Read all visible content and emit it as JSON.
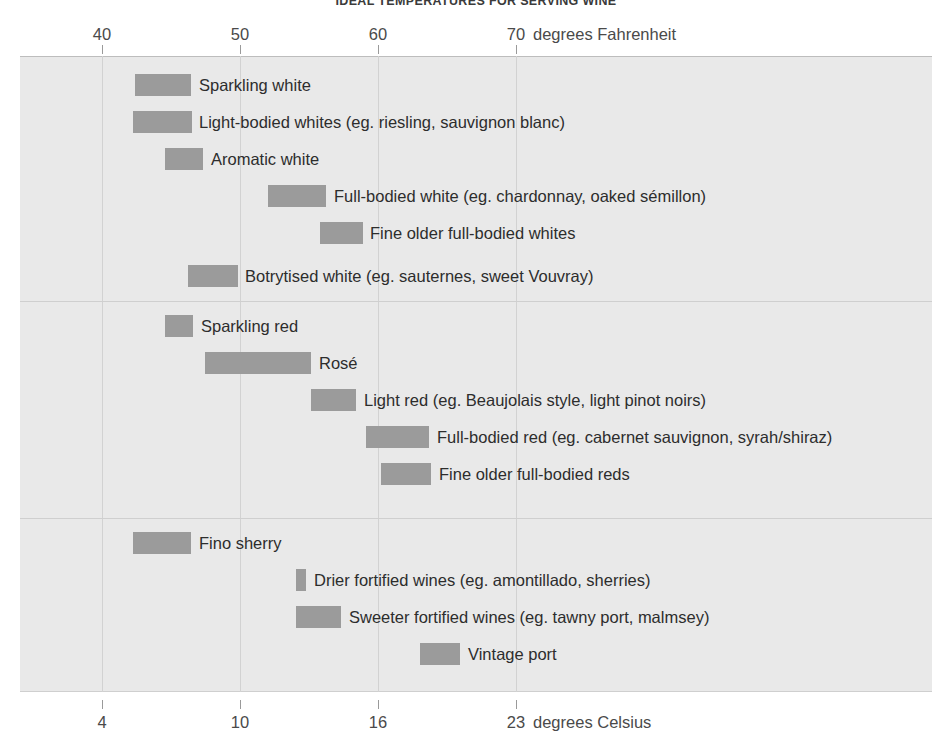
{
  "title": "IDEAL TEMPERATURES FOR SERVING WINE",
  "axis_top": {
    "unit_label": "degrees Fahrenheit",
    "ticks": [
      {
        "label": "40",
        "value": 40
      },
      {
        "label": "50",
        "value": 50
      },
      {
        "label": "60",
        "value": 60
      },
      {
        "label": "70",
        "value": 70
      }
    ]
  },
  "axis_bottom": {
    "unit_label": "degrees Celsius",
    "ticks": [
      {
        "label": "4",
        "value": 4
      },
      {
        "label": "10",
        "value": 10
      },
      {
        "label": "16",
        "value": 16
      },
      {
        "label": "23",
        "value": 23
      }
    ]
  },
  "colors": {
    "bar": "#9b9b9b",
    "plot_background": "#e9e9e9",
    "grid": "#d2d2d2",
    "text": "#2d2d2d"
  },
  "chart_data": {
    "type": "bar",
    "orientation": "horizontal",
    "title": "IDEAL TEMPERATURES FOR SERVING WINE",
    "xlabel": "degrees Fahrenheit",
    "xlabel_secondary": "degrees Celsius",
    "ylabel": "",
    "xlim": [
      32.6,
      98
    ],
    "grid": true,
    "legend": "none",
    "value_unit": "degrees Fahrenheit (range low to high)",
    "note": "Each bar spans the recommended serving temperature range for that wine style.",
    "groups": [
      {
        "name": "White wines",
        "items": [
          {
            "label": "Sparkling white",
            "low_f": 39.5,
            "high_f": 43.5,
            "low_c": 4.2,
            "high_c": 6.4
          },
          {
            "label": "Light-bodied whites (eg. riesling, sauvignon blanc)",
            "low_f": 39.3,
            "high_f": 43.6,
            "low_c": 4.1,
            "high_c": 6.4
          },
          {
            "label": "Aromatic white",
            "low_f": 41.6,
            "high_f": 44.4,
            "low_c": 5.3,
            "high_c": 6.9
          },
          {
            "label": "Full-bodied white (eg. chardonnay, oaked sémillon)",
            "low_f": 49.1,
            "high_f": 53.3,
            "low_c": 9.5,
            "high_c": 11.8
          },
          {
            "label": "Fine older full-bodied whites",
            "low_f": 52.9,
            "high_f": 56.0,
            "low_c": 11.6,
            "high_c": 13.3
          },
          {
            "label": "Botrytised white (eg. sauternes, sweet Vouvray)",
            "low_f": 41.2,
            "high_f": 44.8,
            "low_c": 5.1,
            "high_c": 7.1
          }
        ]
      },
      {
        "name": "Red wines",
        "items": [
          {
            "label": "Sparkling red",
            "low_f": 41.9,
            "high_f": 43.9,
            "low_c": 5.5,
            "high_c": 6.6
          },
          {
            "label": "Rosé",
            "low_f": 44.8,
            "high_f": 52.5,
            "low_c": 7.1,
            "high_c": 11.4
          },
          {
            "label": "Light red (eg. Beaujolais style, light pinot noirs)",
            "low_f": 52.5,
            "high_f": 55.7,
            "low_c": 11.4,
            "high_c": 13.2
          },
          {
            "label": "Full-bodied red (eg. cabernet sauvignon, syrah/shiraz)",
            "low_f": 56.5,
            "high_f": 61.1,
            "low_c": 13.6,
            "high_c": 16.2
          },
          {
            "label": "Fine older full-bodied reds",
            "low_f": 57.6,
            "high_f": 61.2,
            "low_c": 14.2,
            "high_c": 16.2
          }
        ]
      },
      {
        "name": "Fortified wines",
        "items": [
          {
            "label": "Fino sherry",
            "low_f": 39.3,
            "high_f": 43.5,
            "low_c": 4.1,
            "high_c": 6.4
          },
          {
            "label": "Drier fortified wines (eg. amontillado, sherries)",
            "low_f": 52.7,
            "high_f": 53.4,
            "low_c": 11.5,
            "high_c": 11.9
          },
          {
            "label": "Sweeter fortified wines (eg. tawny port, malmsey)",
            "low_f": 52.7,
            "high_f": 56.0,
            "low_c": 11.5,
            "high_c": 13.3
          },
          {
            "label": "Vintage port",
            "low_f": 61.6,
            "high_f": 64.5,
            "low_c": 16.4,
            "high_c": 18.1
          }
        ]
      }
    ]
  },
  "rows": [
    {
      "label": "Sparkling white",
      "x": 115,
      "w": 56,
      "label_x": 179,
      "y": 18
    },
    {
      "label": "Light-bodied whites (eg. riesling, sauvignon blanc)",
      "x": 113,
      "w": 59,
      "label_x": 179,
      "y": 55
    },
    {
      "label": "Aromatic white",
      "x": 145,
      "w": 38,
      "label_x": 191,
      "y": 92
    },
    {
      "label": "Full-bodied white (eg. chardonnay, oaked sémillon)",
      "x": 248,
      "w": 58,
      "label_x": 314,
      "y": 129
    },
    {
      "label": "Fine older full-bodied whites",
      "x": 300,
      "w": 43,
      "label_x": 350,
      "y": 166
    },
    {
      "label": "Botrytised white (eg. sauternes, sweet Vouvray)",
      "x": 168,
      "w": 50,
      "label_x": 225,
      "y": 209
    },
    {
      "label": "Sparkling red",
      "x": 145,
      "w": 28,
      "label_x": 181,
      "y": 259
    },
    {
      "label": "Rosé",
      "x": 185,
      "w": 106,
      "label_x": 299,
      "y": 296
    },
    {
      "label": "Light red (eg. Beaujolais style, light pinot noirs)",
      "x": 291,
      "w": 45,
      "label_x": 344,
      "y": 333
    },
    {
      "label": "Full-bodied red (eg. cabernet sauvignon, syrah/shiraz)",
      "x": 346,
      "w": 63,
      "label_x": 417,
      "y": 370
    },
    {
      "label": "Fine older full-bodied reds",
      "x": 361,
      "w": 50,
      "label_x": 419,
      "y": 407
    },
    {
      "label": "Fino sherry",
      "x": 113,
      "w": 58,
      "label_x": 179,
      "y": 476
    },
    {
      "label": "Drier fortified wines (eg. amontillado, sherries)",
      "x": 276,
      "w": 10,
      "label_x": 294,
      "y": 513
    },
    {
      "label": "Sweeter fortified wines (eg. tawny port, malmsey)",
      "x": 276,
      "w": 45,
      "label_x": 329,
      "y": 550
    },
    {
      "label": "Vintage port",
      "x": 400,
      "w": 40,
      "label_x": 448,
      "y": 587
    }
  ],
  "gridlines_x": [
    82,
    220,
    358,
    496
  ],
  "separators_y": [
    245,
    462
  ]
}
